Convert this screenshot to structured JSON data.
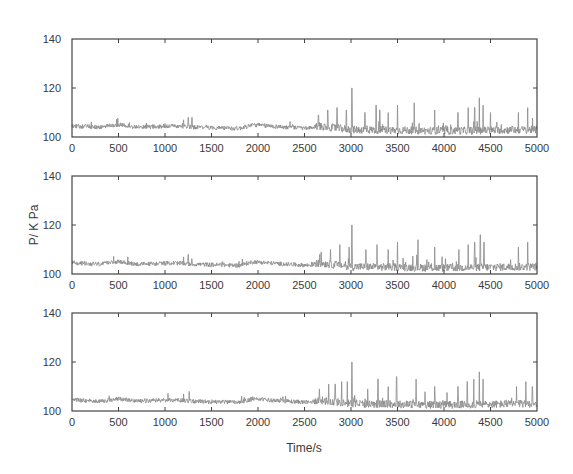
{
  "chart_data": [
    {
      "type": "line",
      "title": "",
      "xlabel": "",
      "ylabel": "",
      "xlim": [
        0,
        5000
      ],
      "ylim": [
        100,
        140
      ],
      "x_ticks": [
        0,
        500,
        1000,
        1500,
        2000,
        2500,
        3000,
        3500,
        4000,
        4500,
        5000
      ],
      "y_ticks": [
        100,
        120,
        140
      ],
      "grid": false,
      "series": [
        {
          "name": "pressure",
          "color": "#8a8a8a",
          "baseline_segments": [
            [
              0,
              104.5
            ],
            [
              300,
              104
            ],
            [
              500,
              105
            ],
            [
              700,
              104
            ],
            [
              1100,
              104.5
            ],
            [
              1300,
              104
            ],
            [
              1800,
              103.5
            ],
            [
              1950,
              105
            ],
            [
              2300,
              104
            ],
            [
              2550,
              103.5
            ],
            [
              2650,
              104.5
            ],
            [
              3000,
              103
            ],
            [
              4000,
              102.5
            ],
            [
              5000,
              103
            ]
          ],
          "spikes": [
            [
              1200,
              107
            ],
            [
              1250,
              108
            ],
            [
              1290,
              108
            ],
            [
              2650,
              109
            ],
            [
              2750,
              111
            ],
            [
              2850,
              112
            ],
            [
              2950,
              111
            ],
            [
              3010,
              120
            ],
            [
              3150,
              110
            ],
            [
              3270,
              113
            ],
            [
              3310,
              111
            ],
            [
              3400,
              110
            ],
            [
              3500,
              113
            ],
            [
              3680,
              114
            ],
            [
              3900,
              111
            ],
            [
              4150,
              110
            ],
            [
              4260,
              112
            ],
            [
              4330,
              112
            ],
            [
              4380,
              116
            ],
            [
              4420,
              113
            ],
            [
              4500,
              110
            ],
            [
              4800,
              110
            ],
            [
              4900,
              112
            ]
          ]
        }
      ]
    },
    {
      "type": "line",
      "title": "",
      "xlabel": "",
      "ylabel": "P/ K Pa",
      "xlim": [
        0,
        5000
      ],
      "ylim": [
        100,
        140
      ],
      "x_ticks": [
        0,
        500,
        1000,
        1500,
        2000,
        2500,
        3000,
        3500,
        4000,
        4500,
        5000
      ],
      "y_ticks": [
        100,
        120,
        140
      ],
      "grid": false,
      "series": [
        {
          "name": "pressure",
          "color": "#8a8a8a",
          "baseline_segments": [
            [
              0,
              104.5
            ],
            [
              300,
              104
            ],
            [
              500,
              105
            ],
            [
              700,
              104
            ],
            [
              1100,
              104.5
            ],
            [
              1300,
              104
            ],
            [
              1800,
              103.5
            ],
            [
              1950,
              105
            ],
            [
              2300,
              104
            ],
            [
              2550,
              103.5
            ],
            [
              2650,
              104.5
            ],
            [
              3000,
              103
            ],
            [
              4000,
              102.5
            ],
            [
              5000,
              103
            ]
          ],
          "spikes": [
            [
              1200,
              107
            ],
            [
              1250,
              108
            ],
            [
              2680,
              109
            ],
            [
              2780,
              110
            ],
            [
              2880,
              112
            ],
            [
              2980,
              111
            ],
            [
              3010,
              120
            ],
            [
              3160,
              110
            ],
            [
              3280,
              112
            ],
            [
              3400,
              110
            ],
            [
              3500,
              113
            ],
            [
              3720,
              114
            ],
            [
              3900,
              111
            ],
            [
              4160,
              110
            ],
            [
              4260,
              112
            ],
            [
              4330,
              113
            ],
            [
              4390,
              116
            ],
            [
              4430,
              113
            ],
            [
              4800,
              111
            ],
            [
              4900,
              113
            ]
          ]
        }
      ]
    },
    {
      "type": "line",
      "title": "",
      "xlabel": "Time/s",
      "ylabel": "",
      "xlim": [
        0,
        5000
      ],
      "ylim": [
        100,
        140
      ],
      "x_ticks": [
        0,
        500,
        1000,
        1500,
        2000,
        2500,
        3000,
        3500,
        4000,
        4500,
        5000
      ],
      "y_ticks": [
        100,
        120,
        140
      ],
      "grid": false,
      "series": [
        {
          "name": "pressure",
          "color": "#8a8a8a",
          "baseline_segments": [
            [
              0,
              104.5
            ],
            [
              300,
              104
            ],
            [
              500,
              105
            ],
            [
              700,
              104
            ],
            [
              1100,
              104.5
            ],
            [
              1300,
              104
            ],
            [
              1800,
              103.5
            ],
            [
              1950,
              105
            ],
            [
              2300,
              104
            ],
            [
              2550,
              103.5
            ],
            [
              2650,
              104.5
            ],
            [
              3000,
              103
            ],
            [
              4000,
              102.5
            ],
            [
              5000,
              103
            ]
          ],
          "spikes": [
            [
              1200,
              107
            ],
            [
              1260,
              108
            ],
            [
              2660,
              109
            ],
            [
              2760,
              111
            ],
            [
              2830,
              111
            ],
            [
              2900,
              112
            ],
            [
              2960,
              112
            ],
            [
              3010,
              120
            ],
            [
              3180,
              109
            ],
            [
              3290,
              113
            ],
            [
              3400,
              110
            ],
            [
              3490,
              114
            ],
            [
              3700,
              113
            ],
            [
              3900,
              110
            ],
            [
              4150,
              110
            ],
            [
              4250,
              112
            ],
            [
              4320,
              113
            ],
            [
              4380,
              116
            ],
            [
              4420,
              113
            ],
            [
              4780,
              110
            ],
            [
              4880,
              112
            ],
            [
              4950,
              110
            ]
          ]
        }
      ]
    }
  ],
  "figure": {
    "ylabel": "P/ K Pa",
    "xlabel": "Time/s"
  }
}
